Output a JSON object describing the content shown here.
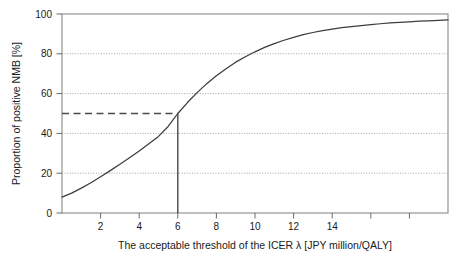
{
  "figure": {
    "background_color": "#ffffff",
    "curve_color": "#3c3c3c",
    "grid_color": "#9a9a9a",
    "frame_color": "#8a8a8a",
    "reference_color": "#4a4a4a"
  },
  "chart_data": {
    "type": "line",
    "title": "",
    "xlabel": "The acceptable threshold of the ICER λ [JPY million/QALY]",
    "ylabel": "Proportion of positive NMB [%]",
    "xlim": [
      0,
      20
    ],
    "ylim": [
      0,
      100
    ],
    "grid": true,
    "grid_axis": "y",
    "grid_values": [
      20,
      40,
      60,
      80
    ],
    "legend_position": "none",
    "xticks": [
      0,
      2,
      4,
      6,
      8,
      10,
      12,
      14,
      16,
      18,
      20
    ],
    "xticklabels": [
      "",
      "2",
      "4",
      "6",
      "8",
      "10",
      "12",
      "14",
      "",
      "",
      ""
    ],
    "yticks": [
      0,
      20,
      40,
      60,
      80,
      100
    ],
    "yticklabels": [
      "0",
      "20",
      "40",
      "60",
      "80",
      "100"
    ],
    "series": [
      {
        "name": "Cost-effectiveness acceptability curve",
        "x": [
          0,
          0.5,
          1,
          1.5,
          2,
          2.5,
          3,
          3.5,
          4,
          4.5,
          5,
          5.5,
          6,
          6.5,
          7,
          7.5,
          8,
          8.5,
          9,
          9.5,
          10,
          10.5,
          11,
          11.5,
          12,
          12.5,
          13,
          13.5,
          14,
          14.5,
          15,
          15.5,
          16,
          16.5,
          17,
          17.5,
          18,
          18.5,
          19,
          19.5,
          20
        ],
        "values": [
          8,
          10,
          12.5,
          15.2,
          18.2,
          21.3,
          24.5,
          27.8,
          31.2,
          34.8,
          38.5,
          43.5,
          50,
          55.5,
          60.5,
          65,
          69,
          72.5,
          75.8,
          78.5,
          81,
          83.2,
          85.1,
          86.8,
          88.3,
          89.6,
          90.7,
          91.6,
          92.4,
          93.1,
          93.7,
          94.2,
          94.7,
          95.1,
          95.5,
          95.8,
          96.1,
          96.4,
          96.6,
          96.8,
          97
        ]
      }
    ],
    "annotations": [
      {
        "name": "threshold-reference",
        "type": "crosshair",
        "x": 6,
        "y": 50,
        "horizontal_style": "dashed",
        "vertical_style": "solid",
        "description": "50% proportion of positive NMB at threshold 6 JPY million/QALY"
      }
    ]
  }
}
